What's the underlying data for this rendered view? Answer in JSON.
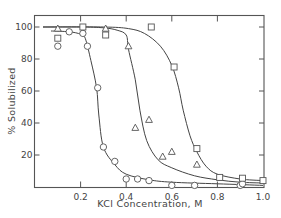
{
  "chart_data": {
    "type": "scatter",
    "title": "",
    "xlabel": "KCl Concentration, M",
    "ylabel": "% Solubilized",
    "xlim": [
      0,
      1.0
    ],
    "ylim": [
      0,
      105
    ],
    "x_ticks": [
      0.2,
      0.4,
      0.6,
      0.8,
      1.0
    ],
    "x_tick_labels": [
      "0.2",
      "0.4",
      "0.6",
      "0.8",
      "1.0"
    ],
    "y_ticks": [
      20,
      40,
      60,
      80,
      100
    ],
    "y_tick_labels": [
      "20",
      "40",
      "60",
      "80",
      "100"
    ],
    "grid": false,
    "legend": null,
    "series": [
      {
        "name": "circles",
        "marker": "circle",
        "points": [
          [
            0.1,
            88
          ],
          [
            0.15,
            97
          ],
          [
            0.21,
            96
          ],
          [
            0.23,
            88
          ],
          [
            0.275,
            62
          ],
          [
            0.3,
            25
          ],
          [
            0.35,
            16
          ],
          [
            0.4,
            5
          ],
          [
            0.45,
            5
          ],
          [
            0.5,
            4
          ],
          [
            0.6,
            1
          ],
          [
            0.7,
            1
          ],
          [
            0.9,
            1
          ],
          [
            0.91,
            2
          ]
        ],
        "fit_curve": [
          [
            0.07,
            97.5
          ],
          [
            0.15,
            97
          ],
          [
            0.2,
            95.5
          ],
          [
            0.22,
            93
          ],
          [
            0.245,
            79
          ],
          [
            0.27,
            62
          ],
          [
            0.28,
            45
          ],
          [
            0.3,
            25
          ],
          [
            0.35,
            14
          ],
          [
            0.4,
            8
          ],
          [
            0.5,
            4.5
          ],
          [
            0.6,
            3
          ],
          [
            0.8,
            2
          ],
          [
            1.0,
            1
          ]
        ]
      },
      {
        "name": "triangles",
        "marker": "triangle",
        "points": [
          [
            0.1,
            99
          ],
          [
            0.31,
            99
          ],
          [
            0.41,
            88
          ],
          [
            0.44,
            37
          ],
          [
            0.5,
            42
          ],
          [
            0.56,
            19
          ],
          [
            0.6,
            22
          ],
          [
            0.71,
            14
          ]
        ],
        "fit_curve": [
          [
            0.035,
            100
          ],
          [
            0.2,
            100
          ],
          [
            0.3,
            99.5
          ],
          [
            0.36,
            98
          ],
          [
            0.4,
            95
          ],
          [
            0.41,
            86
          ],
          [
            0.44,
            67
          ],
          [
            0.46,
            48
          ],
          [
            0.49,
            29
          ],
          [
            0.54,
            17
          ],
          [
            0.6,
            12
          ],
          [
            0.7,
            7
          ],
          [
            0.8,
            4.5
          ],
          [
            0.9,
            3
          ],
          [
            1.0,
            2.5
          ]
        ]
      },
      {
        "name": "squares",
        "marker": "square",
        "points": [
          [
            0.1,
            93
          ],
          [
            0.21,
            100
          ],
          [
            0.31,
            95
          ],
          [
            0.51,
            100
          ],
          [
            0.61,
            75
          ],
          [
            0.71,
            24
          ],
          [
            0.81,
            6
          ],
          [
            0.91,
            5.5
          ],
          [
            1.0,
            4
          ]
        ],
        "fit_curve": [
          [
            0.035,
            100
          ],
          [
            0.3,
            100
          ],
          [
            0.41,
            99
          ],
          [
            0.48,
            96
          ],
          [
            0.55,
            88
          ],
          [
            0.6,
            76
          ],
          [
            0.63,
            62
          ],
          [
            0.65,
            48
          ],
          [
            0.68,
            32
          ],
          [
            0.71,
            22
          ],
          [
            0.75,
            13
          ],
          [
            0.8,
            8
          ],
          [
            0.9,
            5
          ],
          [
            1.0,
            4
          ]
        ]
      }
    ]
  }
}
